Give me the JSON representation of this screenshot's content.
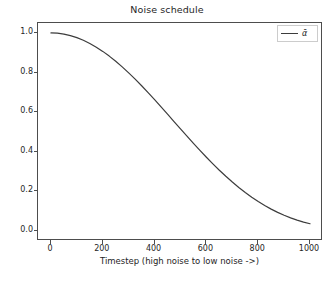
{
  "chart_data": {
    "type": "line",
    "title": "Noise schedule",
    "xlabel": "Timestep (high noise to low noise ->)",
    "ylabel": "",
    "xlim": [
      -50,
      1050
    ],
    "ylim": [
      -0.05,
      1.05
    ],
    "grid": false,
    "legend_position": "upper right",
    "xticks": [
      0,
      200,
      400,
      600,
      800,
      1000
    ],
    "xtick_labels": [
      "0",
      "200",
      "400",
      "600",
      "800",
      "1000"
    ],
    "yticks": [
      0.0,
      0.2,
      0.4,
      0.6,
      0.8,
      1.0
    ],
    "ytick_labels": [
      "0.0",
      "0.2",
      "0.4",
      "0.6",
      "0.8",
      "1.0"
    ],
    "series": [
      {
        "name": "ᾱ",
        "color": "#3c3c3c",
        "linewidth": 1.2,
        "x": [
          0,
          25,
          50,
          75,
          100,
          125,
          150,
          175,
          200,
          225,
          250,
          275,
          300,
          325,
          350,
          375,
          400,
          425,
          450,
          475,
          500,
          525,
          550,
          575,
          600,
          625,
          650,
          675,
          700,
          725,
          750,
          775,
          800,
          825,
          850,
          875,
          900,
          925,
          950,
          975,
          1000
        ],
        "values": [
          1.0,
          0.9985,
          0.994,
          0.9866,
          0.9762,
          0.963,
          0.9469,
          0.9281,
          0.9068,
          0.883,
          0.8569,
          0.8287,
          0.7986,
          0.7667,
          0.7333,
          0.6987,
          0.6631,
          0.6267,
          0.5899,
          0.5528,
          0.5157,
          0.4789,
          0.4426,
          0.4071,
          0.3725,
          0.3391,
          0.307,
          0.2764,
          0.2474,
          0.2202,
          0.1947,
          0.171,
          0.1491,
          0.1291,
          0.1109,
          0.0945,
          0.0798,
          0.0668,
          0.0554,
          0.0455,
          0.0371
        ]
      }
    ]
  },
  "legend": {
    "entries": [
      {
        "label": "ᾱ"
      }
    ]
  },
  "axes": {
    "frame_color": "#4d4d4d"
  }
}
